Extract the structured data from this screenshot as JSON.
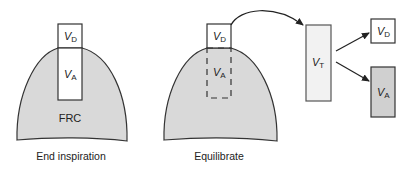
{
  "colors": {
    "outline": "#333333",
    "lung_fill": "#d9d9d9",
    "box_white": "#ffffff",
    "vt_fill": "#f2f2f2",
    "va_fill": "#d0d0d0"
  },
  "panel_end_inspiration": {
    "caption": "End inspiration",
    "vd_label": {
      "main": "V",
      "sub": "D"
    },
    "va_label": {
      "main": "V",
      "sub": "A"
    },
    "frc_label": "FRC"
  },
  "panel_equilibrate": {
    "caption": "Equilibrate",
    "vd_label": {
      "main": "V",
      "sub": "D"
    },
    "va_label": {
      "main": "V",
      "sub": "A"
    }
  },
  "panel_tidal": {
    "vt_label": {
      "main": "V",
      "sub": "T"
    },
    "vd_label": {
      "main": "V",
      "sub": "D"
    },
    "va_label": {
      "main": "V",
      "sub": "A"
    }
  }
}
